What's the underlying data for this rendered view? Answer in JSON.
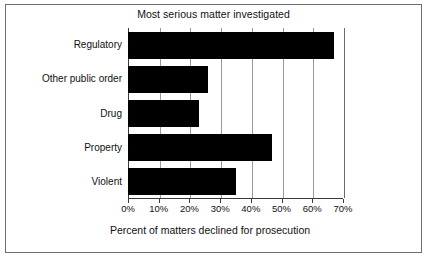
{
  "chart_data": {
    "type": "bar",
    "orientation": "horizontal",
    "title": "Most serious matter investigated",
    "xlabel": "Percent of matters declined for prosecution",
    "ylabel": "",
    "categories": [
      "Regulatory",
      "Other public order",
      "Drug",
      "Property",
      "Violent"
    ],
    "values": [
      67,
      26,
      23,
      47,
      35
    ],
    "xlim": [
      0,
      70
    ],
    "xticks": [
      0,
      10,
      20,
      30,
      40,
      50,
      60,
      70
    ],
    "xtick_labels": [
      "0%",
      "10%",
      "20%",
      "30%",
      "40%",
      "50%",
      "60%",
      "70%"
    ],
    "grid": true,
    "grid_axis": "x",
    "legend": false,
    "bar_color": "#000000",
    "background_color": "#ffffff",
    "border_color": "#6e6e6e",
    "gridline_color": "#9a9a9a",
    "axis_color": "#3a3a3a"
  }
}
